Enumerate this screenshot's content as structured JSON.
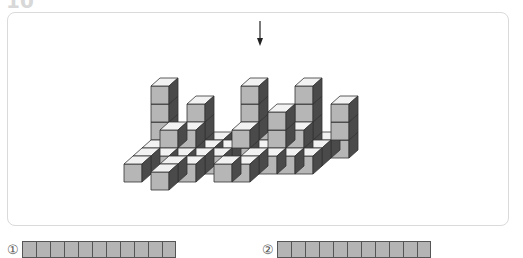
{
  "problem": {
    "number": "10"
  },
  "figure": {
    "arrow_label": "view-direction",
    "colors": {
      "front": "#b6b6b6",
      "top": "#f2f2f2",
      "side": "#4a4a4a",
      "edge": "#333333"
    },
    "cube_size": 18,
    "columns": [
      {
        "x": 0,
        "z": 0,
        "h": 4
      },
      {
        "x": 1,
        "z": 0,
        "h": 1
      },
      {
        "x": 2,
        "z": 0,
        "h": 3
      },
      {
        "x": 3,
        "z": 0,
        "h": 1
      },
      {
        "x": 4,
        "z": 0,
        "h": 1
      },
      {
        "x": 5,
        "z": 0,
        "h": 4
      },
      {
        "x": 6,
        "z": 0,
        "h": 2
      },
      {
        "x": 7,
        "z": 0,
        "h": 1
      },
      {
        "x": 8,
        "z": 0,
        "h": 4
      },
      {
        "x": 9,
        "z": 0,
        "h": 1
      },
      {
        "x": 10,
        "z": 0,
        "h": 3
      },
      {
        "x": 0,
        "z": 1,
        "h": 1
      },
      {
        "x": 1,
        "z": 1,
        "h": 2
      },
      {
        "x": 2,
        "z": 1,
        "h": 2
      },
      {
        "x": 3,
        "z": 1,
        "h": 1
      },
      {
        "x": 4,
        "z": 1,
        "h": 1
      },
      {
        "x": 5,
        "z": 1,
        "h": 2
      },
      {
        "x": 6,
        "z": 1,
        "h": 1
      },
      {
        "x": 7,
        "z": 1,
        "h": 3
      },
      {
        "x": 8,
        "z": 1,
        "h": 2
      },
      {
        "x": 9,
        "z": 1,
        "h": 1
      },
      {
        "x": 0,
        "z": 2,
        "h": 1
      },
      {
        "x": 1,
        "z": 2,
        "h": 1
      },
      {
        "x": 2,
        "z": 2,
        "h": 1
      },
      {
        "x": 3,
        "z": 2,
        "h": 1
      },
      {
        "x": 4,
        "z": 2,
        "h": 1
      },
      {
        "x": 6,
        "z": 2,
        "h": 1
      },
      {
        "x": 7,
        "z": 2,
        "h": 1
      },
      {
        "x": 8,
        "z": 2,
        "h": 1
      },
      {
        "x": 9,
        "z": 2,
        "h": 1
      },
      {
        "x": 0,
        "z": 3,
        "h": 1
      },
      {
        "x": 2,
        "z": 3,
        "h": 1
      },
      {
        "x": 3,
        "z": 3,
        "h": 1
      },
      {
        "x": 5,
        "z": 3,
        "h": 1
      },
      {
        "x": 6,
        "z": 3,
        "h": 1
      },
      {
        "x": 2,
        "z": 4,
        "h": 1
      }
    ]
  },
  "options": [
    {
      "label": "①",
      "squares": 11
    },
    {
      "label": "②",
      "squares": 11
    }
  ]
}
